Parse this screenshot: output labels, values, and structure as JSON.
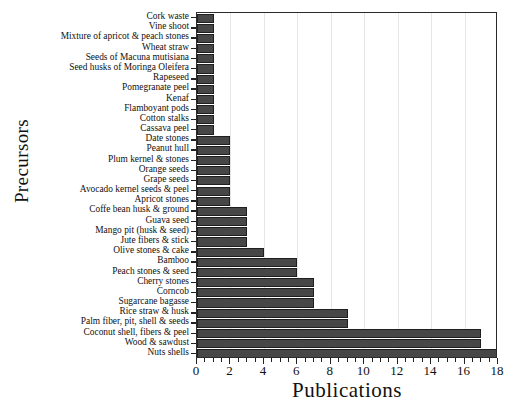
{
  "chart_data": {
    "type": "bar",
    "orientation": "horizontal",
    "title": "",
    "xlabel": "Publications",
    "ylabel": "Precursors",
    "xlim": [
      0,
      18
    ],
    "xticks": [
      0,
      2,
      4,
      6,
      8,
      10,
      12,
      14,
      16,
      18
    ],
    "xtick_labels": [
      "0",
      "2",
      "4",
      "6",
      "8",
      "10",
      "12",
      "14",
      "16",
      "18"
    ],
    "minor_tick_step": 0.5,
    "grid": "vertical-light",
    "legend": "none",
    "bar_color": "#474747",
    "bar_edge_color": "#1f1f1f",
    "categories": [
      "Cork waste",
      "Vine shoot",
      "Mixture of apricot & peach stones",
      "Wheat straw",
      "Seeds of Macuna mutisiana",
      "Seed husks of  Moringa Oleifera",
      "Rapeseed",
      "Pomegranate peel",
      "Kenaf",
      "Flamboyant pods",
      "Cotton stalks",
      "Cassava peel",
      "Date stones",
      "Peanut hull",
      "Plum kernel & stones",
      "Orange seeds",
      "Grape seeds",
      "Avocado kernel seeds & peel",
      "Apricot stones",
      "Coffe bean husk & ground",
      "Guava seed",
      "Mango pit (husk & seed)",
      "Jute fibers & stick",
      "Olive stones & cake",
      "Bamboo",
      "Peach stones & seed",
      "Cherry stones",
      "Corncob",
      "Sugarcane bagasse",
      "Rice straw & husk",
      "Palm fiber, pit, shell & seeds",
      "Coconut shell, fibers & peel",
      "Wood & sawdust",
      "Nuts shells"
    ],
    "values": [
      1,
      1,
      1,
      1,
      1,
      1,
      1,
      1,
      1,
      1,
      1,
      1,
      2,
      2,
      2,
      2,
      2,
      2,
      2,
      3,
      3,
      3,
      3,
      4,
      6,
      6,
      7,
      7,
      7,
      9,
      9,
      17,
      17,
      18
    ]
  }
}
